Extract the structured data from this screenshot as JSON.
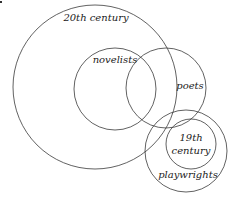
{
  "diagram": {
    "type": "venn",
    "stroke_color": "#3a3a3a",
    "text_color": "#222222",
    "background": "#ffffff",
    "sets": [
      {
        "id": "20th-century",
        "label": "20th century",
        "cx": 95,
        "cy": 87,
        "r": 82,
        "label_x": 96,
        "label_y": 21
      },
      {
        "id": "novelists",
        "label": "novelists",
        "cx": 115,
        "cy": 89,
        "r": 41,
        "label_x": 115,
        "label_y": 63
      },
      {
        "id": "poets",
        "label": "poets",
        "cx": 166,
        "cy": 88,
        "r": 40,
        "label_x": 190,
        "label_y": 89
      },
      {
        "id": "playwrights",
        "label": "playwrights",
        "cx": 186,
        "cy": 151,
        "r": 41,
        "label_x": 188,
        "label_y": 178
      },
      {
        "id": "19th-century",
        "label_lines": [
          "19th",
          "century"
        ],
        "cx": 191,
        "cy": 144,
        "r": 25,
        "label_x": 191,
        "label_y": 141,
        "line_height": 13
      }
    ]
  }
}
